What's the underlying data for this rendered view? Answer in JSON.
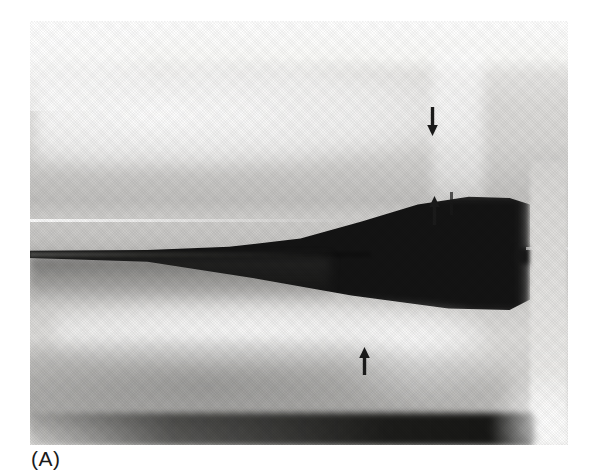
{
  "figure": {
    "type": "radiograph-scan",
    "panel_label": "(A)",
    "annotations": [
      {
        "id": "upper-arrow",
        "direction": "down",
        "points_to": "upper bone distal margin"
      },
      {
        "id": "middle-arrow",
        "direction": "up",
        "points_to": "lower margin of upper bone at dark wedge"
      },
      {
        "id": "lower-arrow",
        "direction": "up",
        "points_to": "upper margin of lower bone"
      }
    ],
    "colors": {
      "page_background": "#ffffff",
      "film_light_gray": "#dcdbd9",
      "film_dark": "#141414",
      "arrow": "#1b1b1b",
      "label_text": "#1a1a1a"
    }
  }
}
